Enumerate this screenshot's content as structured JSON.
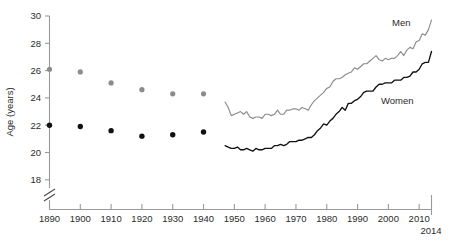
{
  "chart_data": {
    "type": "line",
    "title": "",
    "xlabel": "",
    "ylabel": "Age (years)",
    "xlim": [
      1890,
      2014
    ],
    "ylim": [
      17.4,
      30
    ],
    "yticks": [
      18,
      20,
      22,
      24,
      26,
      28,
      30
    ],
    "ytick_labels": [
      "18",
      "20",
      "22",
      "24",
      "26",
      "28",
      "30"
    ],
    "xticks": [
      1890,
      1900,
      1910,
      1920,
      1930,
      1940,
      1950,
      1960,
      1970,
      1980,
      1990,
      2000,
      2010
    ],
    "xtick_labels": [
      "1890",
      "1900",
      "1910",
      "1920",
      "1930",
      "1940",
      "1950",
      "1960",
      "1970",
      "1980",
      "1990",
      "2000",
      "2010"
    ],
    "x_end_label": "2014",
    "grid": false,
    "axis_break": {
      "present": true,
      "below_value": 18,
      "style": "double-slash"
    },
    "legend": {
      "position": "inline-annotation"
    },
    "series": [
      {
        "name": "Men",
        "label": "Men",
        "color": "#8c8c8c",
        "marker_color": "#8c8c8c",
        "style": "scatter+line",
        "scatter_points": [
          {
            "x": 1890,
            "y": 26.1
          },
          {
            "x": 1900,
            "y": 25.9
          },
          {
            "x": 1910,
            "y": 25.1
          },
          {
            "x": 1920,
            "y": 24.6
          },
          {
            "x": 1930,
            "y": 24.3
          },
          {
            "x": 1940,
            "y": 24.3
          }
        ],
        "line_points": [
          {
            "x": 1947,
            "y": 23.7
          },
          {
            "x": 1948,
            "y": 23.3
          },
          {
            "x": 1949,
            "y": 22.7
          },
          {
            "x": 1950,
            "y": 22.8
          },
          {
            "x": 1951,
            "y": 22.9
          },
          {
            "x": 1952,
            "y": 23.0
          },
          {
            "x": 1953,
            "y": 22.8
          },
          {
            "x": 1954,
            "y": 23.0
          },
          {
            "x": 1955,
            "y": 22.6
          },
          {
            "x": 1956,
            "y": 22.5
          },
          {
            "x": 1957,
            "y": 22.6
          },
          {
            "x": 1958,
            "y": 22.6
          },
          {
            "x": 1959,
            "y": 22.5
          },
          {
            "x": 1960,
            "y": 22.8
          },
          {
            "x": 1961,
            "y": 22.8
          },
          {
            "x": 1962,
            "y": 22.7
          },
          {
            "x": 1963,
            "y": 22.8
          },
          {
            "x": 1964,
            "y": 23.1
          },
          {
            "x": 1965,
            "y": 22.8
          },
          {
            "x": 1966,
            "y": 22.8
          },
          {
            "x": 1967,
            "y": 23.1
          },
          {
            "x": 1968,
            "y": 23.1
          },
          {
            "x": 1969,
            "y": 23.2
          },
          {
            "x": 1970,
            "y": 23.2
          },
          {
            "x": 1971,
            "y": 23.1
          },
          {
            "x": 1972,
            "y": 23.3
          },
          {
            "x": 1973,
            "y": 23.2
          },
          {
            "x": 1974,
            "y": 23.1
          },
          {
            "x": 1975,
            "y": 23.5
          },
          {
            "x": 1976,
            "y": 23.8
          },
          {
            "x": 1977,
            "y": 24.0
          },
          {
            "x": 1978,
            "y": 24.2
          },
          {
            "x": 1979,
            "y": 24.4
          },
          {
            "x": 1980,
            "y": 24.7
          },
          {
            "x": 1981,
            "y": 24.8
          },
          {
            "x": 1982,
            "y": 25.2
          },
          {
            "x": 1983,
            "y": 25.4
          },
          {
            "x": 1984,
            "y": 25.4
          },
          {
            "x": 1985,
            "y": 25.5
          },
          {
            "x": 1986,
            "y": 25.7
          },
          {
            "x": 1987,
            "y": 25.8
          },
          {
            "x": 1988,
            "y": 25.9
          },
          {
            "x": 1989,
            "y": 26.2
          },
          {
            "x": 1990,
            "y": 26.1
          },
          {
            "x": 1991,
            "y": 26.3
          },
          {
            "x": 1992,
            "y": 26.5
          },
          {
            "x": 1993,
            "y": 26.5
          },
          {
            "x": 1994,
            "y": 26.7
          },
          {
            "x": 1995,
            "y": 26.9
          },
          {
            "x": 1996,
            "y": 27.1
          },
          {
            "x": 1997,
            "y": 26.8
          },
          {
            "x": 1998,
            "y": 26.7
          },
          {
            "x": 1999,
            "y": 26.9
          },
          {
            "x": 2000,
            "y": 26.8
          },
          {
            "x": 2001,
            "y": 26.9
          },
          {
            "x": 2002,
            "y": 26.9
          },
          {
            "x": 2003,
            "y": 27.1
          },
          {
            "x": 2004,
            "y": 27.4
          },
          {
            "x": 2005,
            "y": 27.1
          },
          {
            "x": 2006,
            "y": 27.5
          },
          {
            "x": 2007,
            "y": 27.7
          },
          {
            "x": 2008,
            "y": 27.6
          },
          {
            "x": 2009,
            "y": 28.1
          },
          {
            "x": 2010,
            "y": 28.2
          },
          {
            "x": 2011,
            "y": 28.7
          },
          {
            "x": 2012,
            "y": 28.6
          },
          {
            "x": 2013,
            "y": 29.0
          },
          {
            "x": 2014,
            "y": 29.7
          }
        ]
      },
      {
        "name": "Women",
        "label": "Women",
        "color": "#111111",
        "marker_color": "#111111",
        "style": "scatter+line",
        "scatter_points": [
          {
            "x": 1890,
            "y": 22.0
          },
          {
            "x": 1900,
            "y": 21.9
          },
          {
            "x": 1910,
            "y": 21.6
          },
          {
            "x": 1920,
            "y": 21.2
          },
          {
            "x": 1930,
            "y": 21.3
          },
          {
            "x": 1940,
            "y": 21.5
          }
        ],
        "line_points": [
          {
            "x": 1947,
            "y": 20.5
          },
          {
            "x": 1948,
            "y": 20.4
          },
          {
            "x": 1949,
            "y": 20.3
          },
          {
            "x": 1950,
            "y": 20.3
          },
          {
            "x": 1951,
            "y": 20.4
          },
          {
            "x": 1952,
            "y": 20.2
          },
          {
            "x": 1953,
            "y": 20.2
          },
          {
            "x": 1954,
            "y": 20.3
          },
          {
            "x": 1955,
            "y": 20.2
          },
          {
            "x": 1956,
            "y": 20.1
          },
          {
            "x": 1957,
            "y": 20.3
          },
          {
            "x": 1958,
            "y": 20.2
          },
          {
            "x": 1959,
            "y": 20.2
          },
          {
            "x": 1960,
            "y": 20.3
          },
          {
            "x": 1961,
            "y": 20.3
          },
          {
            "x": 1962,
            "y": 20.3
          },
          {
            "x": 1963,
            "y": 20.5
          },
          {
            "x": 1964,
            "y": 20.5
          },
          {
            "x": 1965,
            "y": 20.6
          },
          {
            "x": 1966,
            "y": 20.5
          },
          {
            "x": 1967,
            "y": 20.6
          },
          {
            "x": 1968,
            "y": 20.8
          },
          {
            "x": 1969,
            "y": 20.8
          },
          {
            "x": 1970,
            "y": 20.8
          },
          {
            "x": 1971,
            "y": 20.9
          },
          {
            "x": 1972,
            "y": 20.9
          },
          {
            "x": 1973,
            "y": 21.0
          },
          {
            "x": 1974,
            "y": 21.1
          },
          {
            "x": 1975,
            "y": 21.1
          },
          {
            "x": 1976,
            "y": 21.3
          },
          {
            "x": 1977,
            "y": 21.6
          },
          {
            "x": 1978,
            "y": 21.8
          },
          {
            "x": 1979,
            "y": 22.1
          },
          {
            "x": 1980,
            "y": 22.0
          },
          {
            "x": 1981,
            "y": 22.3
          },
          {
            "x": 1982,
            "y": 22.5
          },
          {
            "x": 1983,
            "y": 22.8
          },
          {
            "x": 1984,
            "y": 23.0
          },
          {
            "x": 1985,
            "y": 23.3
          },
          {
            "x": 1986,
            "y": 23.1
          },
          {
            "x": 1987,
            "y": 23.6
          },
          {
            "x": 1988,
            "y": 23.6
          },
          {
            "x": 1989,
            "y": 23.8
          },
          {
            "x": 1990,
            "y": 23.9
          },
          {
            "x": 1991,
            "y": 24.1
          },
          {
            "x": 1992,
            "y": 24.4
          },
          {
            "x": 1993,
            "y": 24.5
          },
          {
            "x": 1994,
            "y": 24.5
          },
          {
            "x": 1995,
            "y": 24.5
          },
          {
            "x": 1996,
            "y": 24.8
          },
          {
            "x": 1997,
            "y": 25.0
          },
          {
            "x": 1998,
            "y": 25.0
          },
          {
            "x": 1999,
            "y": 25.1
          },
          {
            "x": 2000,
            "y": 25.1
          },
          {
            "x": 2001,
            "y": 25.1
          },
          {
            "x": 2002,
            "y": 25.3
          },
          {
            "x": 2003,
            "y": 25.3
          },
          {
            "x": 2004,
            "y": 25.3
          },
          {
            "x": 2005,
            "y": 25.5
          },
          {
            "x": 2006,
            "y": 25.5
          },
          {
            "x": 2007,
            "y": 25.6
          },
          {
            "x": 2008,
            "y": 25.9
          },
          {
            "x": 2009,
            "y": 25.9
          },
          {
            "x": 2010,
            "y": 26.1
          },
          {
            "x": 2011,
            "y": 26.5
          },
          {
            "x": 2012,
            "y": 26.6
          },
          {
            "x": 2013,
            "y": 26.6
          },
          {
            "x": 2014,
            "y": 27.4
          }
        ]
      }
    ]
  },
  "axis": {
    "y_title": "Age (years)",
    "x_end_label": "2014"
  },
  "annotations": {
    "men": "Men",
    "women": "Women"
  },
  "colors": {
    "men": "#8c8c8c",
    "women": "#111111",
    "axis": "#9a9a9a",
    "text": "#2b2b2b"
  }
}
